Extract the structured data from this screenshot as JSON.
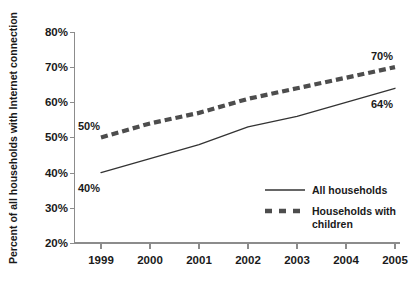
{
  "chart_data": {
    "type": "line",
    "title": "",
    "xlabel": "",
    "ylabel": "Percent of all households with Internet connection",
    "categories": [
      "1999",
      "2000",
      "2001",
      "2002",
      "2003",
      "2004",
      "2005"
    ],
    "x": [
      1999,
      2000,
      2001,
      2002,
      2003,
      2004,
      2005
    ],
    "ylim": [
      20,
      80
    ],
    "yticks": [
      "20%",
      "30%",
      "40%",
      "50%",
      "60%",
      "70%",
      "80%"
    ],
    "ytick_values": [
      20,
      30,
      40,
      50,
      60,
      70,
      80
    ],
    "grid": false,
    "legend_position": "inside-lower-right",
    "series": [
      {
        "name": "All households",
        "style": "solid",
        "color": "#333333",
        "values": [
          40,
          44,
          48,
          53,
          56,
          60,
          64
        ]
      },
      {
        "name": "Households with children",
        "style": "dashed",
        "color": "#4d4d4d",
        "values": [
          50,
          54,
          57,
          61,
          64,
          67,
          70
        ]
      }
    ],
    "annotations": [
      {
        "text": "50%",
        "series": "Households with children",
        "x": 1999,
        "y": 50,
        "position": "above-left"
      },
      {
        "text": "40%",
        "series": "All households",
        "x": 1999,
        "y": 40,
        "position": "below-left"
      },
      {
        "text": "70%",
        "series": "Households with children",
        "x": 2005,
        "y": 70,
        "position": "above-right"
      },
      {
        "text": "64%",
        "series": "All households",
        "x": 2005,
        "y": 64,
        "position": "below-right"
      }
    ]
  },
  "legend": {
    "items": [
      {
        "label": "All households",
        "style": "solid"
      },
      {
        "label": "Households with children",
        "style": "dashed",
        "label_line_1": "Households with",
        "label_line_2": "children"
      }
    ]
  },
  "axis": {
    "y_title": "Percent of all households with Internet connection",
    "y_labels": [
      "80%",
      "70%",
      "60%",
      "50%",
      "40%",
      "30%",
      "20%"
    ],
    "x_labels": [
      "1999",
      "2000",
      "2001",
      "2002",
      "2003",
      "2004",
      "2005"
    ]
  },
  "annotation_labels": {
    "left_dashed": "50%",
    "left_solid": "40%",
    "right_dashed": "70%",
    "right_solid": "64%"
  }
}
